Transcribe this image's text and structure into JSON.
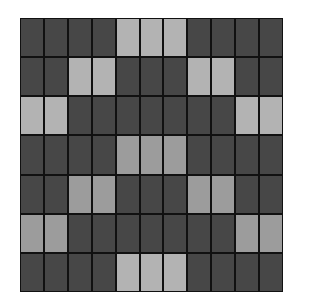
{
  "grid": {
    "rows": 7,
    "cols": 11,
    "colors": {
      "dark": "#474747",
      "light": "#b3b3b3",
      "light_mid": "#9c9c9c",
      "line": "#111111"
    },
    "pattern": [
      [
        0,
        0,
        0,
        0,
        1,
        1,
        1,
        0,
        0,
        0,
        0
      ],
      [
        0,
        0,
        1,
        1,
        0,
        0,
        0,
        1,
        1,
        0,
        0
      ],
      [
        1,
        1,
        0,
        0,
        0,
        0,
        0,
        0,
        0,
        1,
        1
      ],
      [
        0,
        0,
        0,
        0,
        2,
        2,
        2,
        0,
        0,
        0,
        0
      ],
      [
        0,
        0,
        2,
        2,
        0,
        0,
        0,
        2,
        2,
        0,
        0
      ],
      [
        2,
        2,
        0,
        0,
        0,
        0,
        0,
        0,
        0,
        2,
        2
      ],
      [
        0,
        0,
        0,
        0,
        1,
        1,
        1,
        0,
        0,
        0,
        0
      ]
    ]
  }
}
